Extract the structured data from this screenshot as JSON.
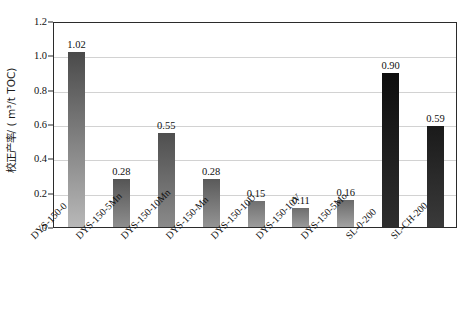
{
  "chart_data": {
    "type": "bar",
    "title": "",
    "subtitle": "",
    "xlabel": "",
    "ylabel": "校正产率/ ( m³/t TOC)",
    "ylim": [
      0,
      1.2
    ],
    "ytick_labels": [
      "0",
      "0.2",
      "0.4",
      "0.6",
      "0.8",
      "1.0",
      "1.2"
    ],
    "ytick_values": [
      0,
      0.2,
      0.4,
      0.6,
      0.8,
      1.0,
      1.2
    ],
    "grid": true,
    "grid_axis": "y",
    "legend": "none",
    "categories": [
      "DYS-150-0",
      "DYS-150-5Mn",
      "DYS-150-10Mn",
      "DYS-150-Mn",
      "DYS-150-10U",
      "DYS-150-10V",
      "DYS-150-5Mo",
      "SL-0-200",
      "SL-CH-200"
    ],
    "values": [
      1.02,
      0.28,
      0.55,
      0.28,
      0.15,
      0.11,
      0.16,
      0.9,
      0.59
    ],
    "data_labels": [
      "1.02",
      "0.28",
      "0.55",
      "0.28",
      "0.15",
      "0.11",
      "0.16",
      "0.90",
      "0.59"
    ],
    "bar_colors_top": [
      "#4a4a4a",
      "#555555",
      "#4f4f4f",
      "#5a5a5a",
      "#707070",
      "#6e6e6e",
      "#6a6a6a",
      "#0e0e0e",
      "#1a1a1a"
    ],
    "bar_colors_bottom": [
      "#b8b8b8",
      "#8e8e8e",
      "#8a8a8a",
      "#949494",
      "#9c9c9c",
      "#9a9a9a",
      "#a2a2a2",
      "#2e2e2e",
      "#3a3a3a"
    ],
    "axis_color": "#2b2b2b",
    "gridline_color": "#d2d2d2",
    "background_color": "#ffffff"
  }
}
